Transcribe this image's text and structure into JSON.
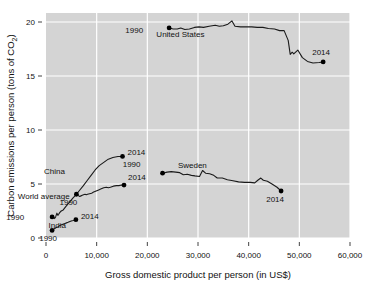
{
  "chart_data": {
    "type": "line",
    "title": "",
    "xlabel": "Gross domestic product per person (in US$)",
    "ylabel": "Carbon emissions per person (tons of CO2)",
    "ylabel_display": "Carbon emissions per person (tons of CO",
    "ylabel_sub": "2",
    "ylabel_tail": ")",
    "xlim": [
      0,
      60000
    ],
    "ylim": [
      0,
      21.5
    ],
    "xticks": [
      0,
      10000,
      20000,
      30000,
      40000,
      50000,
      60000
    ],
    "xticklabels": [
      "0",
      "10,000",
      "20,000",
      "30,000",
      "40,000",
      "50,000",
      "60,000"
    ],
    "yticks": [
      0,
      5,
      10,
      15,
      20
    ],
    "yticklabels": [
      "0",
      "5",
      "10",
      "15",
      "20"
    ],
    "grid": true,
    "grid_color": "#ffffff",
    "panel_color": "#d4d4d4",
    "line_color": "#1a1a1a",
    "point_color": "#000000",
    "legend_position": "inline-annotations",
    "series": [
      {
        "name": "United States",
        "label": "United States",
        "label_x": 36000,
        "label_y": 18.6,
        "start_label": "1990",
        "end_label": "2014",
        "points": [
          [
            24300,
            19.45
          ],
          [
            25100,
            19.35
          ],
          [
            25900,
            19.35
          ],
          [
            26600,
            19.45
          ],
          [
            27400,
            19.3
          ],
          [
            28300,
            19.35
          ],
          [
            29300,
            19.5
          ],
          [
            30200,
            19.55
          ],
          [
            31100,
            19.5
          ],
          [
            32200,
            19.6
          ],
          [
            33400,
            19.7
          ],
          [
            34200,
            19.6
          ],
          [
            35000,
            19.65
          ],
          [
            35900,
            19.8
          ],
          [
            36700,
            20.1
          ],
          [
            37300,
            19.6
          ],
          [
            38400,
            19.55
          ],
          [
            39400,
            19.55
          ],
          [
            40600,
            19.55
          ],
          [
            41700,
            19.5
          ],
          [
            42800,
            19.5
          ],
          [
            43900,
            19.4
          ],
          [
            45100,
            19.35
          ],
          [
            46100,
            19.2
          ],
          [
            47000,
            19.2
          ],
          [
            47800,
            18.3
          ],
          [
            48200,
            17.0
          ],
          [
            48600,
            17.2
          ],
          [
            48900,
            17.05
          ],
          [
            49700,
            17.4
          ],
          [
            50600,
            16.7
          ],
          [
            51600,
            16.35
          ],
          [
            52700,
            16.2
          ],
          [
            53900,
            16.25
          ],
          [
            54700,
            16.3
          ]
        ],
        "start_point": [
          24300,
          19.45
        ],
        "end_point": [
          54700,
          16.3
        ]
      },
      {
        "name": "Sweden",
        "label": "Sweden",
        "label_x": 34500,
        "label_y": 6.5,
        "start_label": "1990",
        "end_label": "2014",
        "points": [
          [
            23000,
            6.0
          ],
          [
            23900,
            6.1
          ],
          [
            24700,
            6.15
          ],
          [
            25600,
            6.1
          ],
          [
            26400,
            6.05
          ],
          [
            27100,
            5.85
          ],
          [
            27900,
            5.9
          ],
          [
            28700,
            5.8
          ],
          [
            29400,
            5.75
          ],
          [
            30300,
            5.7
          ],
          [
            30900,
            6.25
          ],
          [
            31500,
            6.0
          ],
          [
            32300,
            5.95
          ],
          [
            33100,
            5.8
          ],
          [
            33800,
            5.55
          ],
          [
            34800,
            5.55
          ],
          [
            35800,
            5.4
          ],
          [
            36900,
            5.3
          ],
          [
            38000,
            5.2
          ],
          [
            39200,
            5.15
          ],
          [
            40300,
            5.15
          ],
          [
            41200,
            5.1
          ],
          [
            41800,
            5.35
          ],
          [
            42400,
            5.55
          ],
          [
            42900,
            5.35
          ],
          [
            43700,
            5.25
          ],
          [
            44600,
            5.0
          ],
          [
            45600,
            4.7
          ],
          [
            46400,
            4.35
          ]
        ],
        "start_point": [
          23000,
          6.0
        ],
        "end_point": [
          46400,
          4.35
        ]
      },
      {
        "name": "China",
        "label": "China",
        "label_x": 6500,
        "label_y": 5.9,
        "start_label": "1990",
        "end_label": "2014",
        "points": [
          [
            1200,
            1.95
          ],
          [
            1450,
            2.0
          ],
          [
            1700,
            1.8
          ],
          [
            1900,
            1.95
          ],
          [
            2150,
            2.3
          ],
          [
            2350,
            2.1
          ],
          [
            2500,
            2.2
          ],
          [
            2700,
            2.35
          ],
          [
            3000,
            2.5
          ],
          [
            3400,
            2.6
          ],
          [
            3900,
            2.9
          ],
          [
            4600,
            3.3
          ],
          [
            5300,
            3.7
          ],
          [
            6000,
            4.05
          ],
          [
            6600,
            4.4
          ],
          [
            7300,
            4.8
          ],
          [
            8100,
            5.3
          ],
          [
            8900,
            5.8
          ],
          [
            9700,
            6.3
          ],
          [
            10500,
            6.7
          ],
          [
            11400,
            7.0
          ],
          [
            12300,
            7.3
          ],
          [
            13200,
            7.45
          ],
          [
            14200,
            7.55
          ],
          [
            15100,
            7.55
          ]
        ],
        "start_point": [
          1200,
          1.95
        ],
        "end_point": [
          15100,
          7.55
        ]
      },
      {
        "name": "World average",
        "label": "World average",
        "label_x": 10200,
        "label_y": 3.6,
        "start_label": "1990",
        "end_label": "2014",
        "points": [
          [
            6000,
            4.05
          ],
          [
            6250,
            3.95
          ],
          [
            6450,
            3.9
          ],
          [
            6650,
            3.85
          ],
          [
            6900,
            3.9
          ],
          [
            7150,
            3.95
          ],
          [
            7400,
            4.0
          ],
          [
            7700,
            4.05
          ],
          [
            7950,
            4.0
          ],
          [
            8200,
            4.05
          ],
          [
            8600,
            4.1
          ],
          [
            9000,
            4.15
          ],
          [
            9400,
            4.25
          ],
          [
            9900,
            4.35
          ],
          [
            10400,
            4.45
          ],
          [
            10900,
            4.55
          ],
          [
            11400,
            4.65
          ],
          [
            11900,
            4.7
          ],
          [
            12300,
            4.65
          ],
          [
            12700,
            4.7
          ],
          [
            13300,
            4.8
          ],
          [
            13900,
            4.85
          ],
          [
            14400,
            4.85
          ],
          [
            14900,
            4.9
          ],
          [
            15400,
            4.9
          ]
        ],
        "start_point": [
          6000,
          4.05
        ],
        "end_point": [
          15400,
          4.9
        ]
      },
      {
        "name": "India",
        "label": "India",
        "label_x": 3400,
        "label_y": 0.95,
        "start_label": "1990",
        "end_label": "2014",
        "points": [
          [
            1200,
            0.7
          ],
          [
            1300,
            0.72
          ],
          [
            1400,
            0.75
          ],
          [
            1500,
            0.8
          ],
          [
            1650,
            0.85
          ],
          [
            1800,
            0.9
          ],
          [
            1950,
            0.95
          ],
          [
            2100,
            1.0
          ],
          [
            2250,
            1.02
          ],
          [
            2400,
            1.05
          ],
          [
            2550,
            1.1
          ],
          [
            2750,
            1.15
          ],
          [
            2950,
            1.2
          ],
          [
            3200,
            1.25
          ],
          [
            3450,
            1.3
          ],
          [
            3750,
            1.35
          ],
          [
            4050,
            1.4
          ],
          [
            4350,
            1.45
          ],
          [
            4600,
            1.5
          ],
          [
            4850,
            1.55
          ],
          [
            5150,
            1.6
          ],
          [
            5400,
            1.62
          ],
          [
            5600,
            1.65
          ],
          [
            5750,
            1.68
          ],
          [
            5900,
            1.7
          ]
        ],
        "start_point": [
          1200,
          0.7
        ],
        "end_point": [
          5900,
          1.7
        ]
      }
    ],
    "annotations": [
      {
        "text": "1990",
        "x": 24300,
        "y": 19.45,
        "dx": -26,
        "dy": 5,
        "for": "united-states-start"
      },
      {
        "text": "2014",
        "x": 54700,
        "y": 16.3,
        "dx": -2,
        "dy": -7,
        "for": "united-states-end"
      },
      {
        "text": "United States",
        "x": 36000,
        "y": 18.6,
        "dx": -24,
        "dy": 0,
        "for": "united-states-label"
      },
      {
        "text": "1990",
        "x": 23000,
        "y": 6.0,
        "dx": -22,
        "dy": -6,
        "for": "sweden-start"
      },
      {
        "text": "2014",
        "x": 46400,
        "y": 4.35,
        "dx": -6,
        "dy": 11,
        "for": "sweden-end"
      },
      {
        "text": "Sweden",
        "x": 34500,
        "y": 6.5,
        "dx": -14,
        "dy": 0,
        "for": "sweden-label"
      },
      {
        "text": "1990",
        "x": 1200,
        "y": 1.95,
        "dx": -28,
        "dy": 3,
        "for": "china-start"
      },
      {
        "text": "2014",
        "x": 15100,
        "y": 7.55,
        "dx": 5,
        "dy": -2,
        "for": "china-end"
      },
      {
        "text": "China",
        "x": 6500,
        "y": 5.9,
        "dx": -14,
        "dy": 0,
        "for": "china-label"
      },
      {
        "text": "1990",
        "x": 6000,
        "y": 4.05,
        "dx": -8,
        "dy": 11,
        "for": "world-start"
      },
      {
        "text": "2014",
        "x": 15400,
        "y": 4.9,
        "dx": 4,
        "dy": -5,
        "for": "world-end"
      },
      {
        "text": "World average",
        "x": 10200,
        "y": 3.6,
        "dx": -28,
        "dy": 0,
        "for": "world-label"
      },
      {
        "text": "1990",
        "x": 1200,
        "y": 0.7,
        "dx": -4,
        "dy": 11,
        "for": "india-start"
      },
      {
        "text": "2014",
        "x": 5900,
        "y": 1.7,
        "dx": 5,
        "dy": -1,
        "for": "india-end"
      },
      {
        "text": "India",
        "x": 3400,
        "y": 0.95,
        "dx": -6,
        "dy": 0,
        "for": "india-label"
      }
    ]
  }
}
